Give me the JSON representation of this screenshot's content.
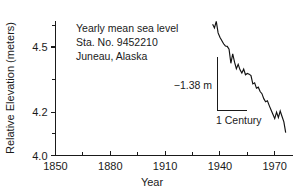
{
  "chart_data": {
    "type": "line",
    "title": "",
    "xlabel": "Year",
    "ylabel": "Relative Elevation (meters)",
    "xlim": [
      1850,
      1980
    ],
    "ylim": [
      4.0,
      4.62
    ],
    "grid": false,
    "legend": null,
    "x_ticks_major": [
      1850,
      1880,
      1910,
      1940,
      1970
    ],
    "x_ticks_major_labels": [
      "1850",
      "1880",
      "1910",
      "1940",
      "1970"
    ],
    "x_ticks_minor": [
      1865,
      1895,
      1925,
      1955
    ],
    "y_ticks_major": [
      4.5,
      4.2,
      4.0
    ],
    "y_ticks_major_labels": [
      "4.5",
      "4.2",
      "4.0"
    ],
    "y_ticks_minor": [
      4.6,
      4.35,
      4.1
    ],
    "series": [
      {
        "name": "Yearly mean sea level",
        "x": [
          1936,
          1937,
          1938,
          1939,
          1940,
          1941,
          1942,
          1943,
          1944,
          1945,
          1946,
          1947,
          1948,
          1949,
          1950,
          1951,
          1952,
          1953,
          1954,
          1955,
          1956,
          1957,
          1958,
          1959,
          1960,
          1961,
          1962,
          1963,
          1964,
          1965,
          1966,
          1967,
          1968,
          1969,
          1970,
          1971,
          1972,
          1973,
          1974,
          1975,
          1976
        ],
        "y": [
          4.605,
          4.588,
          4.618,
          4.565,
          4.545,
          4.53,
          4.515,
          4.505,
          4.503,
          4.49,
          4.425,
          4.468,
          4.43,
          4.4,
          4.42,
          4.395,
          4.38,
          4.398,
          4.372,
          4.378,
          4.375,
          4.368,
          4.33,
          4.335,
          4.31,
          4.315,
          4.295,
          4.285,
          4.262,
          4.248,
          4.252,
          4.23,
          4.21,
          4.19,
          4.17,
          4.2,
          4.175,
          4.205,
          4.18,
          4.155,
          4.105
        ]
      }
    ],
    "annotations": [
      {
        "name": "station-caption",
        "lines": [
          "Yearly mean sea level",
          "Sta. No. 9452210",
          "Juneau, Alaska"
        ]
      },
      {
        "name": "scale-bar",
        "vertical_label": "−1.38 m",
        "horizontal_label": "1 Century"
      }
    ]
  },
  "axes": {
    "x_title": "Year",
    "y_title": "Relative Elevation (meters)"
  },
  "colors": {
    "ink": "#1a1a1a",
    "line": "#111111",
    "background": "#ffffff"
  }
}
